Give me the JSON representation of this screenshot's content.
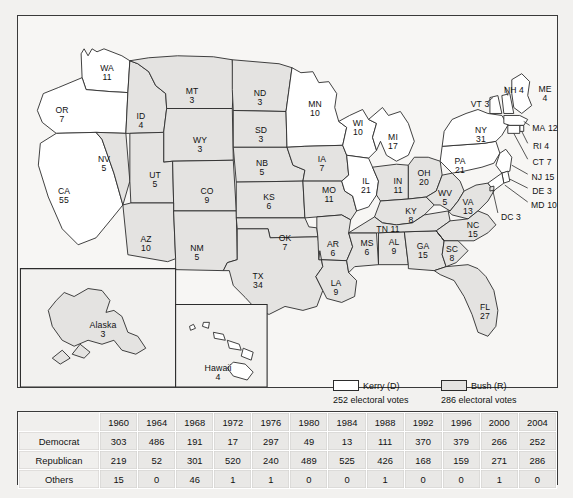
{
  "map": {
    "title_hidden": "",
    "states": [
      {
        "code": "WA",
        "ev": "11",
        "party": "kerry",
        "x": 89,
        "y": 57
      },
      {
        "code": "OR",
        "ev": "7",
        "party": "kerry",
        "x": 44,
        "y": 99
      },
      {
        "code": "CA",
        "ev": "55",
        "party": "kerry",
        "x": 46,
        "y": 180
      },
      {
        "code": "NV",
        "ev": "5",
        "party": "bush",
        "x": 86,
        "y": 148
      },
      {
        "code": "ID",
        "ev": "4",
        "party": "bush",
        "x": 123,
        "y": 105
      },
      {
        "code": "MT",
        "ev": "3",
        "party": "bush",
        "x": 174,
        "y": 80
      },
      {
        "code": "WY",
        "ev": "3",
        "party": "bush",
        "x": 182,
        "y": 129
      },
      {
        "code": "UT",
        "ev": "5",
        "party": "bush",
        "x": 137,
        "y": 164
      },
      {
        "code": "CO",
        "ev": "9",
        "party": "bush",
        "x": 189,
        "y": 180
      },
      {
        "code": "AZ",
        "ev": "10",
        "party": "bush",
        "x": 128,
        "y": 228
      },
      {
        "code": "NM",
        "ev": "5",
        "party": "bush",
        "x": 179,
        "y": 237
      },
      {
        "code": "ND",
        "ev": "3",
        "party": "bush",
        "x": 242,
        "y": 82
      },
      {
        "code": "SD",
        "ev": "3",
        "party": "bush",
        "x": 243,
        "y": 119
      },
      {
        "code": "NB",
        "ev": "5",
        "party": "bush",
        "x": 244,
        "y": 152
      },
      {
        "code": "KS",
        "ev": "6",
        "party": "bush",
        "x": 251,
        "y": 186
      },
      {
        "code": "OK",
        "ev": "7",
        "party": "bush",
        "x": 267,
        "y": 227
      },
      {
        "code": "TX",
        "ev": "34",
        "party": "bush",
        "x": 240,
        "y": 265
      },
      {
        "code": "MN",
        "ev": "10",
        "party": "kerry",
        "x": 297,
        "y": 93
      },
      {
        "code": "IA",
        "ev": "7",
        "party": "bush",
        "x": 304,
        "y": 148
      },
      {
        "code": "MO",
        "ev": "11",
        "party": "bush",
        "x": 311,
        "y": 179
      },
      {
        "code": "AR",
        "ev": "6",
        "party": "bush",
        "x": 315,
        "y": 233
      },
      {
        "code": "LA",
        "ev": "9",
        "party": "bush",
        "x": 318,
        "y": 272
      },
      {
        "code": "WI",
        "ev": "10",
        "party": "kerry",
        "x": 340,
        "y": 112
      },
      {
        "code": "IL",
        "ev": "21",
        "party": "kerry",
        "x": 348,
        "y": 170
      },
      {
        "code": "MS",
        "ev": "6",
        "party": "bush",
        "x": 349,
        "y": 232
      },
      {
        "code": "MI",
        "ev": "17",
        "party": "kerry",
        "x": 375,
        "y": 126
      },
      {
        "code": "IN",
        "ev": "11",
        "party": "bush",
        "x": 380,
        "y": 170
      },
      {
        "code": "AL",
        "ev": "9",
        "party": "bush",
        "x": 376,
        "y": 231
      },
      {
        "code": "OH",
        "ev": "20",
        "party": "bush",
        "x": 406,
        "y": 162
      },
      {
        "code": "KY",
        "ev": "8",
        "party": "bush",
        "x": 393,
        "y": 200
      },
      {
        "code": "GA",
        "ev": "15",
        "party": "bush",
        "x": 405,
        "y": 235
      },
      {
        "code": "WV",
        "ev": "5",
        "party": "bush",
        "x": 427,
        "y": 182
      },
      {
        "code": "VA",
        "ev": "13",
        "party": "bush",
        "x": 450,
        "y": 191
      },
      {
        "code": "NC",
        "ev": "15",
        "party": "bush",
        "x": 455,
        "y": 214
      },
      {
        "code": "SC",
        "ev": "8",
        "party": "bush",
        "x": 434,
        "y": 238
      },
      {
        "code": "FL",
        "ev": "27",
        "party": "bush",
        "x": 467,
        "y": 296
      },
      {
        "code": "PA",
        "ev": "21",
        "party": "kerry",
        "x": 442,
        "y": 150
      },
      {
        "code": "NY",
        "ev": "31",
        "party": "kerry",
        "x": 463,
        "y": 119
      },
      {
        "code": "TN",
        "ev": "11",
        "party": "bush",
        "x": 370,
        "y": 213
      }
    ],
    "inline_labels": [
      {
        "code": "VT",
        "ev": "3",
        "x": 462,
        "y": 88
      },
      {
        "code": "NH",
        "ev": "4",
        "x": 496,
        "y": 74
      },
      {
        "code": "ME",
        "ev": "4",
        "x": 527,
        "y": 78
      },
      {
        "code": "MA",
        "ev": "12",
        "x": 525,
        "y": 112
      },
      {
        "code": "RI",
        "ev": "4",
        "x": 521,
        "y": 130
      },
      {
        "code": "CT",
        "ev": "7",
        "x": 522,
        "y": 146
      },
      {
        "code": "NJ",
        "ev": "15",
        "x": 523,
        "y": 161
      },
      {
        "code": "DE",
        "ev": "3",
        "x": 521,
        "y": 175
      },
      {
        "code": "MD",
        "ev": "10",
        "x": 524,
        "y": 189
      },
      {
        "code": "DC",
        "ev": "3",
        "x": 491,
        "y": 201
      },
      {
        "code": "TN",
        "ev": "11",
        "x": 370,
        "y": 213
      }
    ],
    "insets": [
      {
        "name": "Alaska",
        "ev": "3",
        "x": 85,
        "y": 318
      },
      {
        "name": "Hawaii",
        "ev": "4",
        "x": 203,
        "y": 363
      }
    ]
  },
  "legend": {
    "kerry": {
      "label": "Kerry (D)",
      "votes": "252 electoral votes",
      "color": "#ffffff"
    },
    "bush": {
      "label": "Bush (R)",
      "votes": "286 electoral votes",
      "color": "#e4e3e1"
    }
  },
  "table": {
    "corner": "",
    "years": [
      "1960",
      "1964",
      "1968",
      "1972",
      "1976",
      "1980",
      "1984",
      "1988",
      "1992",
      "1996",
      "2000",
      "2004"
    ],
    "rows": [
      {
        "label": "Democrat",
        "values": [
          "303",
          "486",
          "191",
          "17",
          "297",
          "49",
          "13",
          "111",
          "370",
          "379",
          "266",
          "252"
        ]
      },
      {
        "label": "Republican",
        "values": [
          "219",
          "52",
          "301",
          "520",
          "240",
          "489",
          "525",
          "426",
          "168",
          "159",
          "271",
          "286"
        ]
      },
      {
        "label": "Others",
        "values": [
          "15",
          "0",
          "46",
          "1",
          "1",
          "0",
          "0",
          "1",
          "0",
          "0",
          "1",
          "0"
        ]
      }
    ]
  }
}
